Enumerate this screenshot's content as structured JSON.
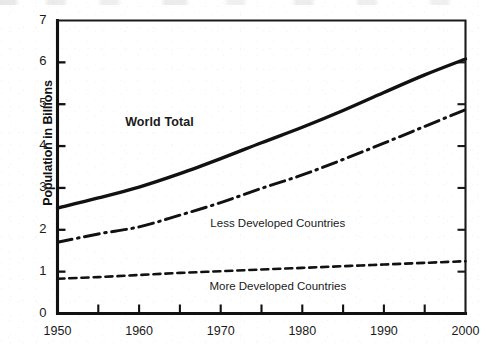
{
  "chart_data": {
    "type": "line",
    "title": "",
    "subtitle": "",
    "xlabel": "",
    "ylabel": "Population in Billions",
    "xlim": [
      1950,
      2000
    ],
    "ylim": [
      0,
      7
    ],
    "grid": false,
    "legend_position": "inline-annotations",
    "x_ticks": [
      1950,
      1960,
      1970,
      1980,
      1990,
      2000
    ],
    "x_tick_labels": [
      "1950",
      "1960",
      "1970",
      "1980",
      "1990",
      "2000"
    ],
    "x_minor_ticks": [
      1955,
      1965,
      1975,
      1985,
      1995
    ],
    "y_ticks": [
      0,
      1,
      2,
      3,
      4,
      5,
      6,
      7
    ],
    "y_tick_labels": [
      "0",
      "1",
      "2",
      "3",
      "4",
      "5",
      "6",
      "7"
    ],
    "x": [
      1950,
      1955,
      1960,
      1965,
      1970,
      1975,
      1980,
      1985,
      1990,
      1995,
      2000
    ],
    "series": [
      {
        "name": "World Total",
        "style": "solid",
        "color": "#111111",
        "width": 3.4,
        "label_bold": true,
        "values": [
          2.52,
          2.76,
          3.02,
          3.34,
          3.7,
          4.08,
          4.45,
          4.85,
          5.28,
          5.7,
          6.08
        ]
      },
      {
        "name": "Less Developed Countries",
        "style": "dash-dot",
        "color": "#111111",
        "width": 3.0,
        "label_bold": false,
        "values": [
          1.7,
          1.9,
          2.07,
          2.35,
          2.65,
          2.99,
          3.31,
          3.68,
          4.07,
          4.47,
          4.87
        ]
      },
      {
        "name": "More Developed Countries",
        "style": "dashed",
        "color": "#111111",
        "width": 2.6,
        "label_bold": false,
        "values": [
          0.83,
          0.87,
          0.92,
          0.97,
          1.01,
          1.05,
          1.09,
          1.13,
          1.17,
          1.21,
          1.25
        ]
      }
    ],
    "annotations": [
      {
        "text": "World Total",
        "x": 1962.5,
        "y": 4.55,
        "bold": true
      },
      {
        "text": "Less Developed Countries",
        "x": 1977.0,
        "y": 2.12,
        "bold": false
      },
      {
        "text": "More Developed Countries",
        "x": 1977.0,
        "y": 0.6,
        "bold": false
      }
    ]
  }
}
